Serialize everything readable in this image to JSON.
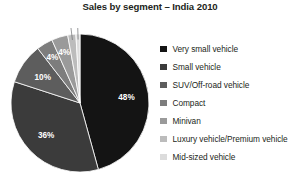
{
  "chart_data": {
    "type": "pie",
    "title": "Sales by segment – India 2010",
    "xlabel": "",
    "ylabel": "",
    "legend_position": "right",
    "grid": false,
    "categories": [
      "Very small vehicle",
      "Small vehicle",
      "SUV/Off-road vehicle",
      "Compact",
      "Minivan",
      "Luxury vehicle/Premium vehicle",
      "Mid-sized vehicle"
    ],
    "values": [
      48,
      36,
      10,
      4,
      4,
      2,
      1
    ],
    "value_labels": [
      "48%",
      "36%",
      "10%",
      "4%",
      "4%",
      "2%",
      "1%"
    ],
    "colors": [
      "#141414",
      "#3b3b3b",
      "#5d5d5d",
      "#7d7d7d",
      "#9a9a9a",
      "#bcbcbc",
      "#dcdcdc"
    ],
    "slices": [
      {
        "label": "Very small vehicle",
        "value": 48,
        "value_label": "48%",
        "color": "#141414",
        "label_fill": "on-dark",
        "leader": false
      },
      {
        "label": "Small vehicle",
        "value": 36,
        "value_label": "36%",
        "color": "#3b3b3b",
        "label_fill": "on-dark",
        "leader": false
      },
      {
        "label": "SUV/Off-road vehicle",
        "value": 10,
        "value_label": "10%",
        "color": "#5d5d5d",
        "label_fill": "on-dark",
        "leader": false
      },
      {
        "label": "Compact",
        "value": 4,
        "value_label": "4%",
        "color": "#7d7d7d",
        "label_fill": "on-dark",
        "leader": false
      },
      {
        "label": "Minivan",
        "value": 4,
        "value_label": "4%",
        "color": "#9a9a9a",
        "label_fill": "on-dark",
        "leader": false
      },
      {
        "label": "Luxury vehicle/Premium vehicle",
        "value": 2,
        "value_label": "2%",
        "color": "#bcbcbc",
        "label_fill": "on-light",
        "leader": true
      },
      {
        "label": "Mid-sized vehicle",
        "value": 1,
        "value_label": "1%",
        "color": "#dcdcdc",
        "label_fill": "on-light",
        "leader": true
      }
    ]
  },
  "legend": {
    "items": [
      {
        "label": "Very small vehicle",
        "color": "#141414"
      },
      {
        "label": "Small vehicle",
        "color": "#3b3b3b"
      },
      {
        "label": "SUV/Off-road vehicle",
        "color": "#5d5d5d"
      },
      {
        "label": "Compact",
        "color": "#7d7d7d"
      },
      {
        "label": "Minivan",
        "color": "#9a9a9a"
      },
      {
        "label": "Luxury vehicle/Premium vehicle",
        "color": "#bcbcbc"
      },
      {
        "label": "Mid-sized vehicle",
        "color": "#dcdcdc"
      }
    ]
  }
}
